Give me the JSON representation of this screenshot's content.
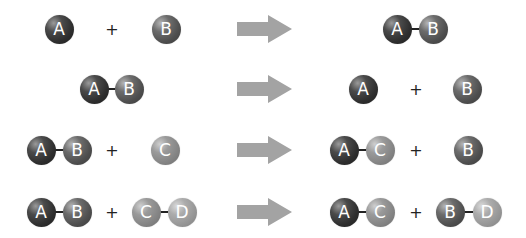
{
  "diagram": {
    "type": "chemical-reaction-schematic",
    "operator_symbol": "+",
    "arrow_color": "#a3a3a3",
    "ball_colors": {
      "A": "#2e2e2e",
      "B": "#4e4e4e",
      "C": "#848484",
      "D": "#969696"
    },
    "reactions": [
      {
        "reactants": [
          [
            "A"
          ],
          [
            "B"
          ]
        ],
        "products": [
          [
            "A",
            "B"
          ]
        ],
        "description": "A + B -> AB"
      },
      {
        "reactants": [
          [
            "A",
            "B"
          ]
        ],
        "products": [
          [
            "A"
          ],
          [
            "B"
          ]
        ],
        "description": "AB -> A + B"
      },
      {
        "reactants": [
          [
            "A",
            "B"
          ],
          [
            "C"
          ]
        ],
        "products": [
          [
            "A",
            "C"
          ],
          [
            "B"
          ]
        ],
        "description": "AB + C -> AC + B"
      },
      {
        "reactants": [
          [
            "A",
            "B"
          ],
          [
            "C",
            "D"
          ]
        ],
        "products": [
          [
            "A",
            "C"
          ],
          [
            "B",
            "D"
          ]
        ],
        "description": "AB + CD -> AC + BD"
      }
    ]
  },
  "labels": {
    "A": "A",
    "B": "B",
    "C": "C",
    "D": "D",
    "plus": "+"
  }
}
